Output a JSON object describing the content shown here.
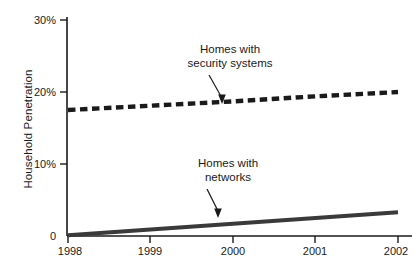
{
  "chart_data": {
    "type": "line",
    "title": "",
    "xlabel": "",
    "ylabel": "Household Penetration",
    "x": [
      1998,
      1999,
      2000,
      2001,
      2002
    ],
    "xlim": [
      1998,
      2002
    ],
    "ylim": [
      0,
      30
    ],
    "grid": false,
    "legend_position": "inline-annotations",
    "x_tick_labels": [
      "1998",
      "1999",
      "2000",
      "2001",
      "2002"
    ],
    "y_tick_labels": [
      "30%",
      "20%",
      "10%",
      "0"
    ],
    "y_tick_values": [
      30,
      20,
      10,
      0
    ],
    "series": [
      {
        "name": "Homes with security systems",
        "style": "dashed",
        "color": "#1a1a1a",
        "values": [
          17.5,
          18.1,
          18.7,
          19.4,
          20.0
        ]
      },
      {
        "name": "Homes with networks",
        "style": "solid",
        "color": "#3a3a3a",
        "values": [
          0.1,
          0.9,
          1.7,
          2.5,
          3.3
        ]
      }
    ],
    "annotations": [
      {
        "id": "security-systems",
        "line1": "Homes with",
        "line2": "security systems",
        "target_x": 2000,
        "target_y": 18.7
      },
      {
        "id": "networks",
        "line1": "Homes with",
        "line2": "networks",
        "target_x": 1999.9,
        "target_y": 2.3
      }
    ]
  }
}
